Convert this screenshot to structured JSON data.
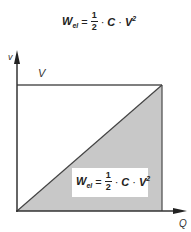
{
  "title_formula": {
    "lhs": "W",
    "lhs_sub": "el",
    "equals": "=",
    "numerator": "1",
    "denominator": "2",
    "dot1": "·",
    "C": "C",
    "dot2": "·",
    "V": "V",
    "exp": "2"
  },
  "diagram": {
    "y_axis_label": "v",
    "x_axis_label": "Q",
    "level_label": "V",
    "area_formula": {
      "lhs": "W",
      "lhs_sub": "el",
      "equals": "=",
      "numerator": "1",
      "denominator": "2",
      "dot1": "·",
      "C": "C",
      "dot2": "·",
      "V": "V",
      "exp": "2"
    },
    "colors": {
      "shaded_area": "#c8c8c8",
      "lines": "#555555",
      "axes": "#333333"
    }
  }
}
